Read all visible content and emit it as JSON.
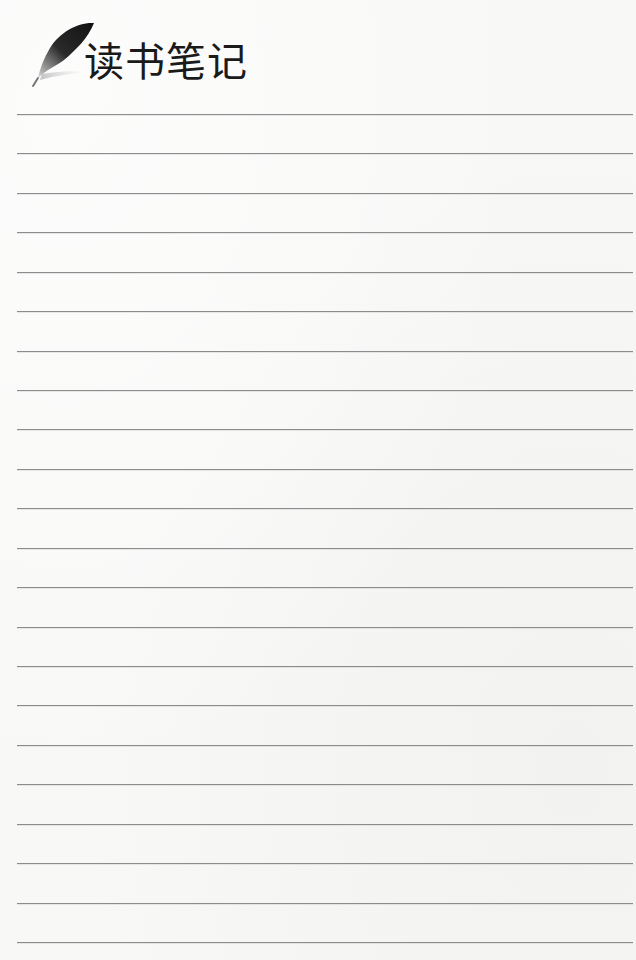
{
  "page": {
    "title": "读书笔记",
    "icon": "feather-quill-icon",
    "colors": {
      "background": "#f8f8f7",
      "rule": "#8c8c8c",
      "title": "#1a1a1a"
    }
  },
  "ruled_lines": {
    "count": 22,
    "first_y": 114,
    "spacing": 39.43,
    "left": 17,
    "right": 633
  }
}
